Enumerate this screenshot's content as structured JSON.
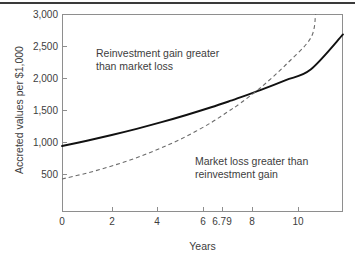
{
  "chart_data": {
    "type": "line",
    "title": "",
    "xlabel": "Years",
    "ylabel": "Accreted values per $1,000",
    "xlim": [
      0,
      11.3
    ],
    "ylim": [
      0,
      3000
    ],
    "grid": false,
    "legend": "none",
    "xticks": [
      {
        "value": 0,
        "label": "0"
      },
      {
        "value": 2,
        "label": "2"
      },
      {
        "value": 4,
        "label": "4"
      },
      {
        "value": 6,
        "label": "6"
      },
      {
        "value": 6.79,
        "label": "6.79"
      },
      {
        "value": 8,
        "label": "8"
      },
      {
        "value": 10,
        "label": "10"
      }
    ],
    "yticks": [
      {
        "value": 500,
        "label": "500"
      },
      {
        "value": 1000,
        "label": "1,000"
      },
      {
        "value": 1500,
        "label": "1,500"
      },
      {
        "value": 2000,
        "label": "2,000"
      },
      {
        "value": 2500,
        "label": "2,500"
      },
      {
        "value": 3000,
        "label": "3,000"
      }
    ],
    "series": [
      {
        "name": "accreted-value-solid",
        "style": "solid",
        "color": "#111111",
        "x": [
          0,
          1,
          2,
          3,
          4,
          5,
          6,
          6.79,
          7,
          8,
          9,
          10,
          11.3
        ],
        "values": [
          1000,
          1080,
          1167,
          1260,
          1361,
          1470,
          1587,
          1686,
          1714,
          1851,
          1999,
          2159,
          2690
        ]
      },
      {
        "name": "market-value-dashed",
        "style": "dashed",
        "color": "#6b6b6b",
        "x": [
          0,
          1,
          2,
          3,
          4,
          5,
          6,
          6.79,
          7,
          8,
          9,
          10,
          10.2
        ],
        "values": [
          500,
          590,
          697,
          823,
          972,
          1147,
          1355,
          1550,
          1600,
          1889,
          2231,
          2635,
          3000
        ]
      }
    ],
    "intersection": {
      "x": 6.79,
      "y": 1580
    },
    "annotations": [
      {
        "name": "reinvestment-gain-region",
        "line1": "Reinvestment gain greater",
        "line2": "than market loss"
      },
      {
        "name": "market-loss-region",
        "line1": "Market loss greater than",
        "line2": "reinvestment gain"
      }
    ]
  }
}
